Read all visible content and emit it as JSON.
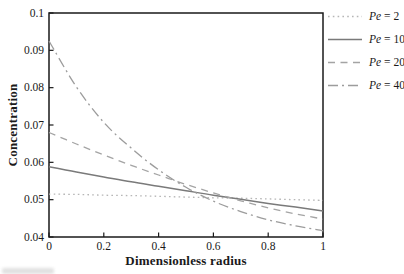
{
  "chart_data": {
    "type": "line",
    "title": "",
    "xlabel": "Dimensionless radius",
    "ylabel": "Concentration",
    "xlim": [
      0,
      1
    ],
    "ylim": [
      0.04,
      0.1
    ],
    "grid": false,
    "legend_position": "right-outside",
    "x_ticks": [
      "0",
      "0.2",
      "0.4",
      "0.6",
      "0.8",
      "1"
    ],
    "x_tick_values": [
      0,
      0.2,
      0.4,
      0.6,
      0.8,
      1
    ],
    "y_ticks": [
      "0.04",
      "0.05",
      "0.06",
      "0.07",
      "0.08",
      "0.09",
      "0.1"
    ],
    "y_tick_values": [
      0.04,
      0.05,
      0.06,
      0.07,
      0.08,
      0.09,
      0.1
    ],
    "axis_color": "#1a1a1a",
    "x": [
      0,
      0.1,
      0.2,
      0.3,
      0.4,
      0.5,
      0.6,
      0.7,
      0.8,
      0.9,
      1.0
    ],
    "series": [
      {
        "name": "Pe = 2",
        "name_italic": "Pe",
        "name_rest": " = 2",
        "style": "dotted",
        "color": "#b6b6b6",
        "dash": "1.6 3.2",
        "width": 1.3,
        "values": [
          0.0515,
          0.0514,
          0.0512,
          0.0511,
          0.0509,
          0.0507,
          0.0505,
          0.0504,
          0.0502,
          0.05,
          0.0498
        ]
      },
      {
        "name": "Pe = 10",
        "name_italic": "Pe",
        "name_rest": " = 10",
        "style": "solid",
        "color": "#7a7a7a",
        "dash": "",
        "width": 1.5,
        "values": [
          0.0588,
          0.0574,
          0.0561,
          0.0548,
          0.0536,
          0.0524,
          0.0512,
          0.0501,
          0.049,
          0.048,
          0.047
        ]
      },
      {
        "name": "Pe = 20",
        "name_italic": "Pe",
        "name_rest": " = 20",
        "style": "dashed",
        "color": "#a4a4a4",
        "dash": "7 5.5",
        "width": 1.3,
        "values": [
          0.068,
          0.0649,
          0.062,
          0.0592,
          0.0566,
          0.0541,
          0.0518,
          0.0497,
          0.0478,
          0.0462,
          0.0448
        ]
      },
      {
        "name": "Pe = 40",
        "name_italic": "Pe",
        "name_rest": " = 40",
        "style": "dashdot",
        "color": "#9c9c9c",
        "dash": "10 4 2 4",
        "width": 1.3,
        "values": [
          0.0925,
          0.0802,
          0.0707,
          0.0638,
          0.058,
          0.0533,
          0.0496,
          0.0468,
          0.0446,
          0.043,
          0.0417
        ]
      }
    ]
  }
}
